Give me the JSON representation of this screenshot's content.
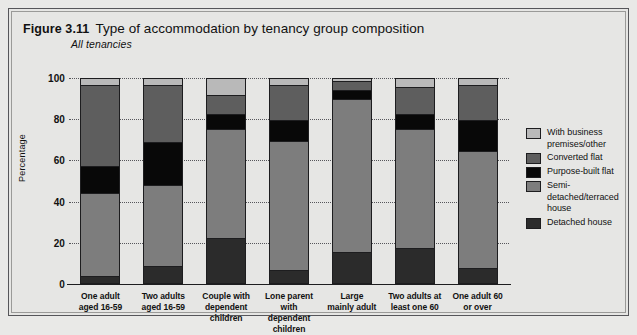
{
  "figure": {
    "number": "Figure 3.11",
    "title": "Type of accommodation by tenancy group composition",
    "subtitle": "All tenancies"
  },
  "axis": {
    "ylabel": "Percentage",
    "yticks": [
      "100",
      "80",
      "60",
      "40",
      "20",
      "0"
    ]
  },
  "legend": [
    {
      "label": "With business premises/other",
      "color": "#b9b9b9"
    },
    {
      "label": "Converted flat",
      "color": "#5e5e5e"
    },
    {
      "label": "Purpose-built flat",
      "color": "#080808"
    },
    {
      "label": "Semi-detached/terraced house",
      "color": "#7d7d7d"
    },
    {
      "label": "Detached house",
      "color": "#2b2b2b"
    }
  ],
  "chart_data": {
    "type": "bar",
    "stacked": true,
    "title": "Type of accommodation by tenancy group composition",
    "subtitle": "All tenancies",
    "xlabel": "",
    "ylabel": "Percentage",
    "ylim": [
      0,
      100
    ],
    "yticks": [
      0,
      20,
      40,
      60,
      80,
      100
    ],
    "grid": true,
    "legend_position": "right",
    "categories": [
      "One adult aged 16-59",
      "Two adults aged 16-59",
      "Couple with dependent children",
      "Lone parent with dependent children",
      "Large mainly adult",
      "Two adults at least one 60",
      "One adult 60 or over"
    ],
    "series": [
      {
        "name": "Detached house",
        "color": "#2b2b2b",
        "values": [
          3,
          8,
          22,
          6,
          15,
          17,
          7
        ]
      },
      {
        "name": "Semi-detached/terraced house",
        "color": "#7d7d7d",
        "values": [
          41,
          40,
          54,
          64,
          76,
          59,
          58
        ]
      },
      {
        "name": "Purpose-built flat",
        "color": "#080808",
        "values": [
          13,
          21,
          7,
          10,
          4,
          7,
          15
        ]
      },
      {
        "name": "Converted flat",
        "color": "#5e5e5e",
        "values": [
          40,
          28,
          9,
          17,
          4,
          13,
          17
        ]
      },
      {
        "name": "With business premises/other",
        "color": "#b9b9b9",
        "values": [
          3,
          3,
          8,
          3,
          1,
          4,
          3
        ]
      }
    ]
  }
}
